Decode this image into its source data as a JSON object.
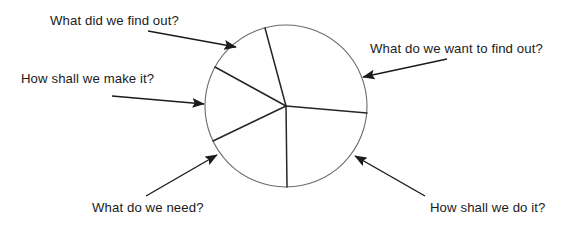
{
  "diagram": {
    "type": "radial-wheel",
    "colors": {
      "circle_stroke": "#6b6b6b",
      "spoke_stroke": "#262626",
      "arrow_stroke": "#1b1b1b",
      "text": "#1b1b1b",
      "background": "#ffffff"
    },
    "wheel": {
      "center_x": 286,
      "center_y": 106,
      "radius": 81,
      "segment_count": 5,
      "spoke_angles_deg": [
        105,
        151,
        206,
        270,
        355
      ]
    },
    "labels": [
      {
        "id": "find-out",
        "text": "What did we find out?",
        "position": "top-left",
        "arrow_from_x": 148,
        "arrow_from_y": 31,
        "arrow_to_x": 236,
        "arrow_to_y": 47
      },
      {
        "id": "want-find-out",
        "text": "What do we want to find out?",
        "position": "right-upper",
        "arrow_from_x": 447,
        "arrow_from_y": 59,
        "arrow_to_x": 363,
        "arrow_to_y": 77
      },
      {
        "id": "make-it",
        "text": "How shall we make it?",
        "position": "left",
        "arrow_from_x": 112,
        "arrow_from_y": 96,
        "arrow_to_x": 204,
        "arrow_to_y": 104
      },
      {
        "id": "need",
        "text": "What do we need?",
        "position": "bottom-left",
        "arrow_from_x": 146,
        "arrow_from_y": 196,
        "arrow_to_x": 217,
        "arrow_to_y": 155
      },
      {
        "id": "do-it",
        "text": "How shall we do it?",
        "position": "bottom-right",
        "arrow_from_x": 425,
        "arrow_from_y": 196,
        "arrow_to_x": 355,
        "arrow_to_y": 156
      }
    ]
  }
}
